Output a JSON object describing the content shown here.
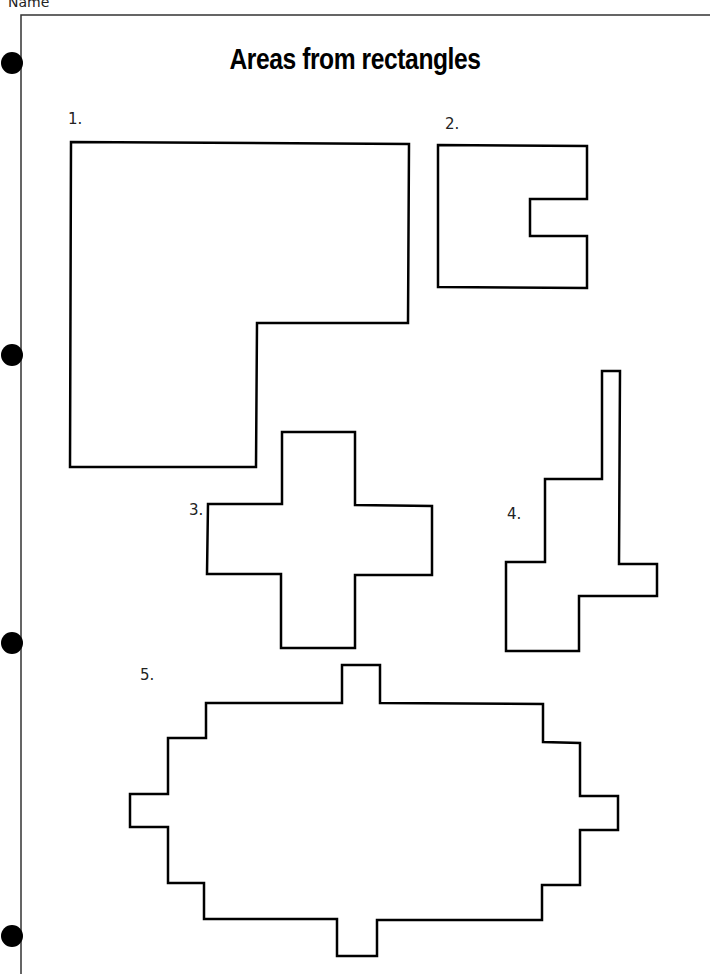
{
  "header": {
    "name_label": "Name"
  },
  "title": "Areas from rectangles",
  "questions": [
    {
      "number": "1.",
      "shape": "L-shape"
    },
    {
      "number": "2.",
      "shape": "C-shape with notch"
    },
    {
      "number": "3.",
      "shape": "cross"
    },
    {
      "number": "4.",
      "shape": "stepped tower"
    },
    {
      "number": "5.",
      "shape": "stepped oval"
    }
  ],
  "colors": {
    "stroke": "#000000",
    "background": "#ffffff"
  }
}
